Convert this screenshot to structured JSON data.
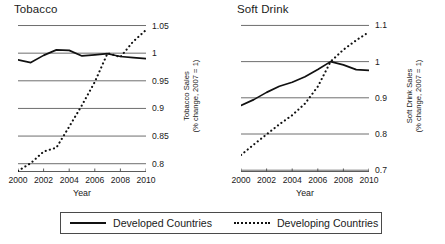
{
  "figure": {
    "xaxis_title": "Year",
    "caption": ""
  },
  "legend": {
    "entries": [
      {
        "label": "Developed Countries",
        "style": "solid"
      },
      {
        "label": "Developing Countries",
        "style": "dashed"
      }
    ]
  },
  "chart_data": [
    {
      "type": "line",
      "title": "Tobacco",
      "xlabel": "Year",
      "ylabel": "Tobacco Sales",
      "ylabel_sub": "(% change, 2007 = 1)",
      "xlim": [
        2000,
        2010
      ],
      "ylim": [
        0.785,
        1.06
      ],
      "grid": true,
      "legend_position": "bottom-outside",
      "xticks": [
        2000,
        2002,
        2004,
        2006,
        2008,
        2010
      ],
      "xticklabels": [
        "2000",
        "2002",
        "2004",
        "2006",
        "2008",
        "2010"
      ],
      "yticks": [
        0.8,
        0.85,
        0.9,
        0.95,
        1,
        1.05
      ],
      "yticklabels": [
        "0.8",
        "0.85",
        "0.9",
        "0.95",
        "1",
        "1.05"
      ],
      "x": [
        2000,
        2001,
        2002,
        2003,
        2004,
        2005,
        2006,
        2007,
        2008,
        2009,
        2010
      ],
      "series": [
        {
          "name": "Developed Countries",
          "style": "solid",
          "values": [
            0.988,
            0.983,
            0.996,
            1.006,
            1.005,
            0.995,
            0.997,
            0.999,
            0.994,
            0.992,
            0.99
          ]
        },
        {
          "name": "Developing Countries",
          "style": "dashed",
          "values": [
            0.787,
            0.801,
            0.822,
            0.829,
            0.867,
            0.906,
            0.948,
            1.0,
            0.993,
            1.021,
            1.042
          ]
        }
      ]
    },
    {
      "type": "line",
      "title": "Soft Drink",
      "xlabel": "Year",
      "ylabel": "Soft Drink Sales",
      "ylabel_sub": "(% change, 2007 = 1)",
      "xlim": [
        2000,
        2010
      ],
      "ylim": [
        0.695,
        1.115
      ],
      "grid": true,
      "legend_position": "bottom-outside",
      "xticks": [
        2000,
        2002,
        2004,
        2006,
        2008,
        2010
      ],
      "xticklabels": [
        "2000",
        "2002",
        "2004",
        "2006",
        "2008",
        "2010"
      ],
      "yticks": [
        0.7,
        0.8,
        0.9,
        1,
        1.1
      ],
      "yticklabels": [
        "0.7",
        "0.8",
        "0.9",
        "1",
        "1.1"
      ],
      "x": [
        2000,
        2001,
        2002,
        2003,
        2004,
        2005,
        2006,
        2007,
        2008,
        2009,
        2010
      ],
      "series": [
        {
          "name": "Developed Countries",
          "style": "solid",
          "values": [
            0.879,
            0.895,
            0.915,
            0.932,
            0.943,
            0.958,
            0.978,
            1.0,
            0.991,
            0.978,
            0.976
          ]
        },
        {
          "name": "Developing Countries",
          "style": "dashed",
          "values": [
            0.742,
            0.771,
            0.799,
            0.827,
            0.852,
            0.884,
            0.931,
            1.0,
            1.033,
            1.059,
            1.082
          ]
        }
      ]
    }
  ]
}
